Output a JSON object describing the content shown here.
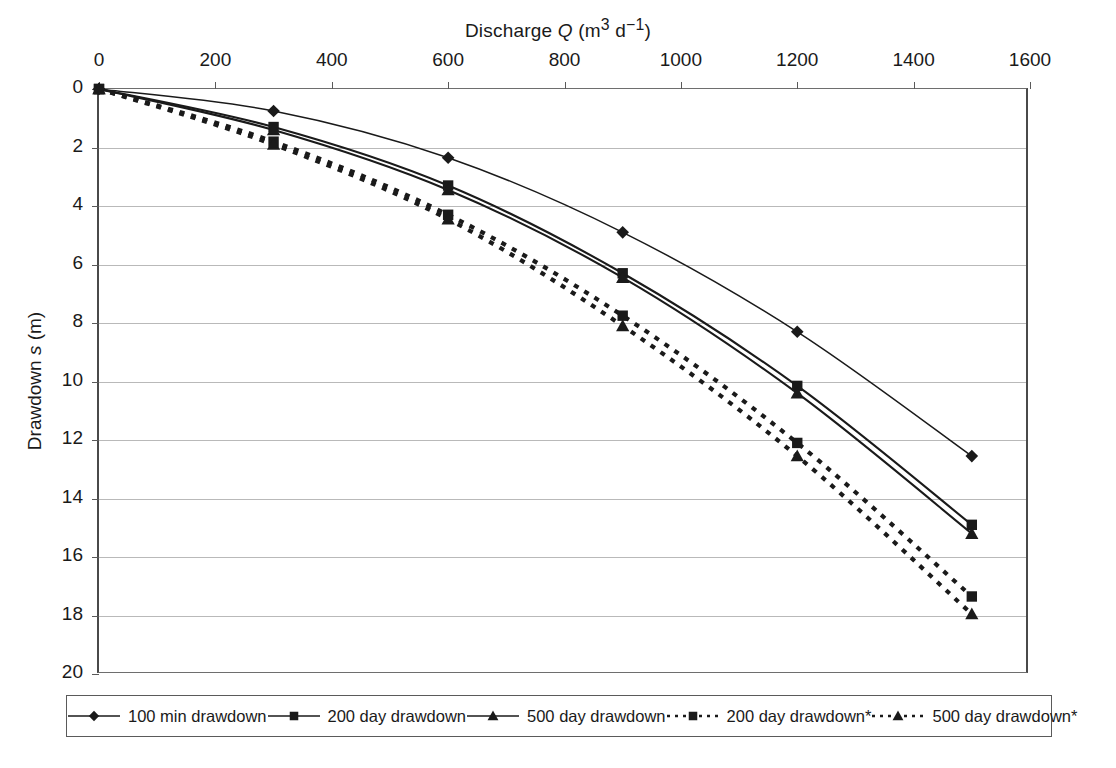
{
  "chart_data": {
    "type": "line",
    "title_parts": {
      "main": "Discharge ",
      "var": "Q",
      "units_pre": " (m",
      "units_sup1": "3",
      "units_mid": " d",
      "units_sup2": "−1",
      "units_post": ")"
    },
    "xlabel": "Discharge Q (m3 d-1)",
    "xlabel_position": "top",
    "ylabel": "Drawdown s (m)",
    "ylabel_parts": {
      "main": "Drawdown ",
      "var": "s",
      "units": " (m)"
    },
    "xlim": [
      0,
      1600
    ],
    "ylim": [
      0,
      20
    ],
    "y_inverted": true,
    "xticks": [
      0,
      200,
      400,
      600,
      800,
      1000,
      1200,
      1400,
      1600
    ],
    "xticklabels": [
      "0",
      "200",
      "400",
      "600",
      "800",
      "1000",
      "1200",
      "1400",
      "1600"
    ],
    "yticks": [
      0,
      2,
      4,
      6,
      8,
      10,
      12,
      14,
      16,
      18,
      20
    ],
    "yticklabels": [
      "0",
      "2",
      "4",
      "6",
      "8",
      "10",
      "12",
      "14",
      "16",
      "18",
      "20"
    ],
    "grid": "horizontal",
    "legend_position": "bottom",
    "x": [
      0,
      300,
      600,
      900,
      1200,
      1500
    ],
    "series": [
      {
        "name": "100 min drawdown",
        "marker": "diamond",
        "linestyle": "solid",
        "color": "#1a1a1a",
        "values": [
          0,
          0.75,
          2.35,
          4.9,
          8.3,
          12.55
        ]
      },
      {
        "name": "200 day drawdown",
        "marker": "square",
        "linestyle": "solid",
        "color": "#1a1a1a",
        "values": [
          0,
          1.3,
          3.3,
          6.3,
          10.15,
          14.9
        ]
      },
      {
        "name": "500 day drawdown",
        "marker": "triangle",
        "linestyle": "solid",
        "color": "#1a1a1a",
        "values": [
          0,
          1.4,
          3.45,
          6.45,
          10.4,
          15.2
        ]
      },
      {
        "name": "200 day drawdown*",
        "marker": "square",
        "linestyle": "dotted",
        "color": "#1a1a1a",
        "values": [
          0,
          1.8,
          4.3,
          7.75,
          12.1,
          17.35
        ]
      },
      {
        "name": "500 day drawdown*",
        "marker": "triangle",
        "linestyle": "dotted",
        "color": "#1a1a1a",
        "values": [
          0,
          1.9,
          4.45,
          8.1,
          12.55,
          17.95
        ]
      }
    ]
  },
  "legend": {
    "items": [
      {
        "label": "100 min drawdown",
        "marker": "diamond",
        "linestyle": "solid"
      },
      {
        "label": "200 day drawdown",
        "marker": "square",
        "linestyle": "solid"
      },
      {
        "label": "500 day drawdown",
        "marker": "triangle",
        "linestyle": "solid"
      },
      {
        "label": "200 day drawdown*",
        "marker": "square",
        "linestyle": "dotted"
      },
      {
        "label": "500 day drawdown*",
        "marker": "triangle",
        "linestyle": "dotted"
      }
    ]
  },
  "colors": {
    "ink": "#1a1a1a",
    "axis": "#4a4a4a",
    "grid": "#b9b9b9",
    "background": "#ffffff"
  }
}
